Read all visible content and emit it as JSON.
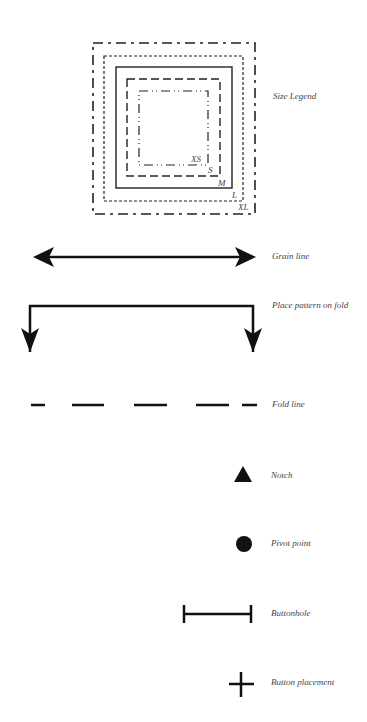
{
  "legend": {
    "size_legend": {
      "label": "Size Legend",
      "sizes": [
        {
          "tag": "XS",
          "line_style": "dash-dot-dot"
        },
        {
          "tag": "S",
          "line_style": "long-dash"
        },
        {
          "tag": "M",
          "line_style": "solid"
        },
        {
          "tag": "L",
          "line_style": "short-dash"
        },
        {
          "tag": "XL",
          "line_style": "long-short-dash"
        }
      ]
    },
    "symbols": [
      {
        "id": "grain-line",
        "label": "Grain line",
        "icon": "double-arrow"
      },
      {
        "id": "place-on-fold",
        "label": "Place pattern on fold",
        "icon": "fold-bracket-arrows"
      },
      {
        "id": "fold-line",
        "label": "Fold line",
        "icon": "dashed-line"
      },
      {
        "id": "notch",
        "label": "Notch",
        "icon": "triangle"
      },
      {
        "id": "pivot-point",
        "label": "Pivot point",
        "icon": "filled-circle"
      },
      {
        "id": "buttonhole",
        "label": "Buttonhole",
        "icon": "i-beam-line"
      },
      {
        "id": "button-placement",
        "label": "Button placement",
        "icon": "cross"
      }
    ]
  },
  "colors": {
    "ink": "#111111",
    "label": "#444444"
  }
}
